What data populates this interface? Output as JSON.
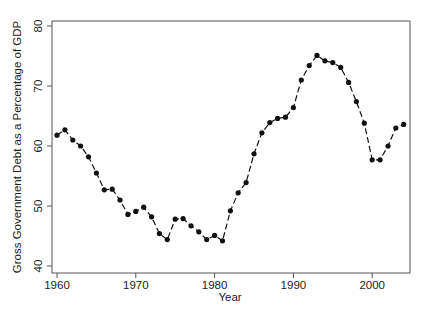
{
  "chart_data": {
    "type": "line",
    "title": "",
    "xlabel": "Year",
    "ylabel": "Gross Government Debt as a Percentage of GDP",
    "xlim": [
      1959.3,
      2005.3
    ],
    "ylim": [
      38.8,
      80.8
    ],
    "xticks": [
      1960,
      1970,
      1980,
      1990,
      2000
    ],
    "yticks": [
      40,
      50,
      60,
      70,
      80
    ],
    "grid": false,
    "legend": null,
    "line_style": "dashed",
    "marker": "filled-circle",
    "color": "#111111",
    "x": [
      1960,
      1961,
      1962,
      1963,
      1964,
      1965,
      1966,
      1967,
      1968,
      1969,
      1970,
      1971,
      1972,
      1973,
      1974,
      1975,
      1976,
      1977,
      1978,
      1979,
      1980,
      1981,
      1982,
      1983,
      1984,
      1985,
      1986,
      1987,
      1988,
      1989,
      1990,
      1991,
      1992,
      1993,
      1994,
      1995,
      1996,
      1997,
      1998,
      1999,
      2000,
      2001,
      2002,
      2003,
      2004
    ],
    "series": [
      {
        "name": "Gross Government Debt (% of GDP)",
        "values": [
          61.8,
          62.7,
          61.0,
          60.0,
          58.2,
          55.5,
          52.7,
          52.8,
          51.0,
          48.6,
          49.1,
          49.8,
          48.2,
          45.4,
          44.4,
          47.8,
          47.9,
          46.7,
          45.7,
          44.4,
          45.1,
          44.2,
          49.2,
          52.2,
          53.9,
          58.7,
          62.2,
          63.9,
          64.6,
          64.8,
          66.4,
          71.0,
          73.4,
          75.1,
          74.2,
          73.9,
          73.1,
          70.6,
          67.4,
          63.8,
          57.7,
          57.7,
          60.0,
          63.0,
          63.6
        ]
      }
    ]
  },
  "labels": {
    "xlabel": "Year",
    "ylabel": "Gross Government Debt as a Percentage of GDP",
    "xticks": [
      "1960",
      "1970",
      "1980",
      "1990",
      "2000"
    ],
    "yticks": [
      "40",
      "50",
      "60",
      "70",
      "80"
    ]
  }
}
